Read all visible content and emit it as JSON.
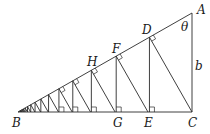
{
  "diagram": {
    "type": "geometry",
    "points": {
      "A": {
        "label": "A",
        "x": 192,
        "y": 13
      },
      "B": {
        "label": "B",
        "x": 18,
        "y": 112
      },
      "C": {
        "label": "C",
        "x": 192,
        "y": 112
      },
      "D": {
        "label": "D"
      },
      "E": {
        "label": "E"
      },
      "F": {
        "label": "F"
      },
      "G": {
        "label": "G"
      },
      "H": {
        "label": "H"
      }
    },
    "angle_label": "θ",
    "side_label": "b",
    "ratio": 0.747,
    "num_iterations": 16,
    "colors": {
      "stroke": "#2a2a2a",
      "text": "#1a1a1a",
      "background": "#ffffff"
    }
  }
}
